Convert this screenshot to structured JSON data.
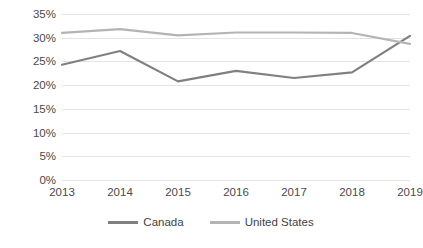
{
  "chart_data": {
    "type": "line",
    "title": "",
    "subtitle": "",
    "xlabel": "",
    "ylabel": "",
    "categories": [
      "2013",
      "2014",
      "2015",
      "2016",
      "2017",
      "2018",
      "2019"
    ],
    "x": [
      2013,
      2014,
      2015,
      2016,
      2017,
      2018,
      2019
    ],
    "ylim": [
      0,
      35
    ],
    "yticks": [
      0,
      5,
      10,
      15,
      20,
      25,
      30,
      35
    ],
    "ytick_labels": [
      "0%",
      "5%",
      "10%",
      "15%",
      "20%",
      "25%",
      "30%",
      "35%"
    ],
    "grid": true,
    "legend_position": "bottom",
    "series": [
      {
        "name": "Canada",
        "color": "#808080",
        "values": [
          24.3,
          27.2,
          20.8,
          23.0,
          21.5,
          22.7,
          30.4
        ]
      },
      {
        "name": "United States",
        "color": "#b4b4b4",
        "values": [
          31.0,
          31.8,
          30.5,
          31.1,
          31.1,
          31.0,
          28.7
        ]
      }
    ]
  },
  "axes": {
    "y_ticks": [
      {
        "label": "35%",
        "value": 35
      },
      {
        "label": "30%",
        "value": 30
      },
      {
        "label": "25%",
        "value": 25
      },
      {
        "label": "20%",
        "value": 20
      },
      {
        "label": "15%",
        "value": 15
      },
      {
        "label": "10%",
        "value": 10
      },
      {
        "label": "5%",
        "value": 5
      },
      {
        "label": "0%",
        "value": 0
      }
    ],
    "x_ticks": [
      {
        "label": "2013"
      },
      {
        "label": "2014"
      },
      {
        "label": "2015"
      },
      {
        "label": "2016"
      },
      {
        "label": "2017"
      },
      {
        "label": "2018"
      },
      {
        "label": "2019"
      }
    ]
  },
  "legend": {
    "items": [
      {
        "label": "Canada",
        "color": "#808080"
      },
      {
        "label": "United States",
        "color": "#b4b4b4"
      }
    ]
  },
  "style": {
    "gridline_color": "#e3e3e3",
    "text_color": "#4a4a4a",
    "background": "#ffffff"
  }
}
